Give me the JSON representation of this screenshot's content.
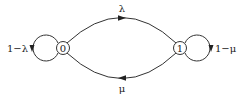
{
  "diagram": {
    "type": "markov-chain",
    "states": [
      {
        "id": "0",
        "label": "0"
      },
      {
        "id": "1",
        "label": "1"
      }
    ],
    "transitions": [
      {
        "from": "0",
        "to": "1",
        "label": "λ"
      },
      {
        "from": "1",
        "to": "0",
        "label": "μ"
      },
      {
        "from": "0",
        "to": "0",
        "label": "1−λ"
      },
      {
        "from": "1",
        "to": "1",
        "label": "1−μ"
      }
    ],
    "colors": {
      "stroke": "#333333",
      "text": "#222222",
      "background": "#ffffff"
    }
  }
}
